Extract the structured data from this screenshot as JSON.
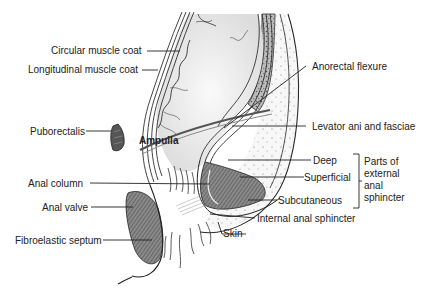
{
  "figure": {
    "labels": {
      "circular_muscle_coat": "Circular muscle coat",
      "longitudinal_muscle_coat": "Longitudinal muscle coat",
      "puborectalis": "Puborectalis",
      "ampulla": "Ampulla",
      "anal_column": "Anal column",
      "anal_valve": "Anal valve",
      "fibroelastic_septum": "Fibroelastic septum",
      "anorectal_flexure": "Anorectal flexure",
      "levator_ani": "Levator ani and fasciae",
      "deep": "Deep",
      "superficial": "Superficial",
      "subcutaneous": "Subcutaneous",
      "internal_anal_sphincter": "Internal anal sphincter",
      "skin": "Skin"
    },
    "bracket_group": {
      "lines": [
        "Parts of",
        "external",
        "anal",
        "sphincter"
      ]
    },
    "colors": {
      "line": "#2a2a2a",
      "muscle": "#6e6e6e",
      "fat": "#f2f2f2",
      "mucosa": "#e6e6e6"
    }
  }
}
